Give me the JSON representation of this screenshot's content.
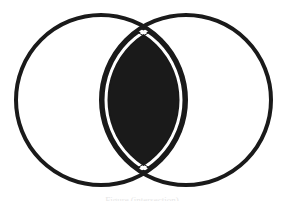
{
  "diagram": {
    "type": "venn",
    "circles": [
      {
        "name": "left-set",
        "cx": 101,
        "cy": 100,
        "r": 85
      },
      {
        "name": "right-set",
        "cx": 186,
        "cy": 100,
        "r": 85
      }
    ],
    "stroke_color": "#1a1a1a",
    "stroke_width": 4,
    "intersection_fill": "#1a1a1a",
    "background": "#ffffff",
    "caption": "Figure (intersection)"
  }
}
